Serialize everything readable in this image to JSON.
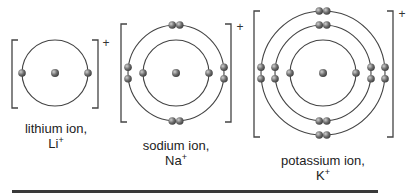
{
  "colors": {
    "line": "#444444",
    "particle_dark": "#4a4a4a",
    "particle_light": "#c8c8c8",
    "rule": "#3a3a3a"
  },
  "ions": [
    {
      "id": "lithium",
      "name": "lithium ion,",
      "symbol": "Li",
      "charge": "+",
      "center": [
        55,
        73
      ],
      "shells": [
        {
          "radius": 33,
          "electron_count": 2
        }
      ],
      "bracket": {
        "left": 12,
        "right": 98,
        "top": 40,
        "bottom": 108
      },
      "charge_pos": [
        106,
        47
      ],
      "label_pos": [
        56,
        121
      ]
    },
    {
      "id": "sodium",
      "name": "sodium ion,",
      "symbol": "Na",
      "charge": "+",
      "center": [
        176,
        73
      ],
      "shells": [
        {
          "radius": 33,
          "electron_count": 2
        },
        {
          "radius": 48,
          "electron_count": 8
        }
      ],
      "bracket": {
        "left": 121,
        "right": 231,
        "top": 24,
        "bottom": 122
      },
      "charge_pos": [
        240,
        31
      ],
      "label_pos": [
        176,
        138
      ]
    },
    {
      "id": "potassium",
      "name": "potassium ion,",
      "symbol": "K",
      "charge": "+",
      "center": [
        323,
        73
      ],
      "shells": [
        {
          "radius": 33,
          "electron_count": 2
        },
        {
          "radius": 48,
          "electron_count": 8
        },
        {
          "radius": 62,
          "electron_count": 8
        }
      ],
      "bracket": {
        "left": 254,
        "right": 393,
        "top": 11,
        "bottom": 137
      },
      "charge_pos": [
        402,
        18
      ],
      "label_pos": [
        323,
        153
      ]
    }
  ]
}
